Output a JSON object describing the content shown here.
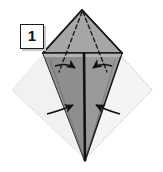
{
  "figure": {
    "kind": "origami-fold-instruction",
    "step_label": "1",
    "alt_text": "Origami step 1: a square sheet rotated as a diamond with a kite shape folded, dashed fold lines from the top apex and four arrows pointing inward toward the vertical center crease.",
    "canvas": {
      "width": 163,
      "height": 172,
      "background": "#ffffff"
    }
  },
  "colors": {
    "paper_front": "#999999",
    "paper_front_left": "#8f8f8f",
    "paper_back": "#f4f4f4",
    "paper_back_shade": "#ededed",
    "outline": "#1a1a1a",
    "dashed_line": "#1a1a1a",
    "dotted_line": "#b8b8b8",
    "arrow": "#111111",
    "badge_border": "#1a1a1a",
    "badge_fill": "#ffffff",
    "badge_shadow": "#c9c9c9",
    "badge_text": "#111111"
  },
  "geometry": {
    "apex": {
      "x": 82,
      "y": 10
    },
    "left_vertex": {
      "x": 43,
      "y": 53
    },
    "right_vertex": {
      "x": 122,
      "y": 53
    },
    "bottom_vertex": {
      "x": 85,
      "y": 161
    },
    "square_diamond": {
      "top": {
        "x": 82,
        "y": 12
      },
      "left": {
        "x": 12,
        "y": 90
      },
      "right": {
        "x": 152,
        "y": 90
      },
      "bottom": {
        "x": 85,
        "y": 159
      }
    },
    "center_crease": {
      "x1": 84,
      "y1": 53,
      "x2": 85,
      "y2": 161
    }
  },
  "elements": {
    "step_badge": {
      "label": "1",
      "shape": "square-outline"
    },
    "center_crease": {
      "name": "center-crease-line",
      "style": "solid-heavy"
    },
    "dashed_folds": [
      {
        "name": "dashed-fold-left",
        "from": "apex",
        "to": "inner-left"
      },
      {
        "name": "dashed-fold-right",
        "from": "apex",
        "to": "inner-right"
      }
    ],
    "arrows": [
      {
        "name": "arrow-upper-left",
        "direction": "right",
        "points_to": "center-crease"
      },
      {
        "name": "arrow-upper-right",
        "direction": "left",
        "points_to": "center-crease"
      },
      {
        "name": "arrow-lower-left",
        "direction": "right",
        "points_to": "center-crease"
      },
      {
        "name": "arrow-lower-right",
        "direction": "left",
        "points_to": "center-crease"
      }
    ]
  }
}
